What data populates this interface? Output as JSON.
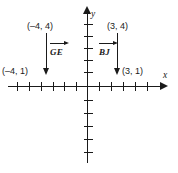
{
  "diagram": {
    "type": "coordinate-plane",
    "axes": {
      "x_label": "x",
      "y_label": "y",
      "x_ticks": [
        -7,
        -6,
        -5,
        -4,
        -3,
        -2,
        -1,
        1,
        2,
        3,
        4,
        5,
        6
      ],
      "y_ticks": [
        1,
        2,
        3,
        4,
        5,
        -1,
        -2,
        -3,
        -4,
        -5
      ],
      "x_arrow": "right",
      "y_arrow": "up"
    },
    "segments": [
      {
        "name": "GE",
        "start_label": "(–4, 4)",
        "end_label": "(–4, 1)",
        "start": [
          -4,
          4
        ],
        "end": [
          -4,
          1
        ],
        "direction": "down",
        "ray_notation": "GE"
      },
      {
        "name": "BJ",
        "start_label": "(3, 4)",
        "end_label": "(3, 1)",
        "start": [
          3,
          4
        ],
        "end": [
          3,
          1
        ],
        "direction": "down",
        "ray_notation": "BJ"
      }
    ],
    "colors": {
      "ink": "#1a1a1a",
      "background": "#ffffff"
    }
  }
}
